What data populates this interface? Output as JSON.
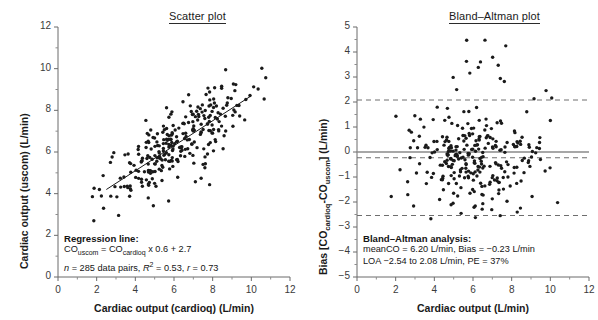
{
  "figure": {
    "left_panel": {
      "title": "Scatter plot",
      "xlabel": "Cardiac output (cardioq) (L/min)",
      "ylabel": "Cardiac output (uscom) (L/min)",
      "annotation": {
        "heading": "Regression line:",
        "equation_prefix": "CO",
        "equation_sub1": "uscom",
        "equation_mid": " = CO",
        "equation_sub2": "cardioq",
        "equation_suffix": " x 0.6 + 2.7",
        "stats_n": "n",
        "stats_rest": " = 285 data pairs, ",
        "stats_r2_base": "R",
        "stats_r2_exp": "2",
        "stats_r2_val": " = 0.53, ",
        "stats_r_base": "r",
        "stats_r_val": " = 0.73"
      }
    },
    "right_panel": {
      "title": "Bland–Altman plot",
      "xlabel": "Cardiac output (L/min)",
      "ylabel": "Bias [COcardioq-COuscom] (L/min)",
      "annotation": {
        "heading": "Bland–Altman analysis:",
        "line2": "meanCO = 6.20 L/min, Bias = −0.23 L/min",
        "line3": "LOA −2.54 to 2.08 L/min, PE = 37%"
      }
    }
  },
  "chart_data": [
    {
      "type": "scatter",
      "id": "scatter-plot",
      "title": "Scatter plot",
      "xlabel": "Cardiac output (cardioq) (L/min)",
      "ylabel": "Cardiac output (uscom) (L/min)",
      "xlim": [
        0,
        12
      ],
      "ylim": [
        0,
        12
      ],
      "xticks": [
        0,
        2,
        4,
        6,
        8,
        10,
        12
      ],
      "yticks": [
        0,
        2,
        4,
        6,
        8,
        10,
        12
      ],
      "minor_ticks": true,
      "grid": false,
      "n_points": 285,
      "marker_color": "#1a1a1a",
      "marker_size_px": 3.4,
      "regression_line": {
        "slope": 0.6,
        "intercept": 2.7,
        "x_start": 2.5,
        "x_end": 10.0,
        "color": "#1a1a1a"
      },
      "statistics": {
        "n": 285,
        "r_squared": 0.53,
        "r": 0.73,
        "equation": "COuscom = COcardioq x 0.6 + 2.7"
      },
      "point_generation": {
        "seed": 20240517,
        "x_mean": 6.2,
        "x_sd": 1.75,
        "x_min": 1.6,
        "x_max": 11.2,
        "residual_sd": 0.82,
        "note": "y = 2.7 + 0.6*x + noise"
      }
    },
    {
      "type": "scatter",
      "id": "bland-altman-plot",
      "title": "Bland–Altman plot",
      "xlabel": "Cardiac output (L/min)",
      "ylabel": "Bias [COcardioq-COuscom] (L/min)",
      "xlim": [
        0,
        12
      ],
      "ylim": [
        -5,
        5
      ],
      "xticks": [
        0,
        2,
        4,
        6,
        8,
        10,
        12
      ],
      "yticks": [
        -5,
        -4,
        -3,
        -2,
        -1,
        0,
        1,
        2,
        3,
        4,
        5
      ],
      "minor_ticks": true,
      "grid": false,
      "n_points": 285,
      "marker_color": "#1a1a1a",
      "marker_size_px": 3.4,
      "reference_lines": [
        {
          "name": "zero-line",
          "value": 0,
          "style": "solid",
          "color": "#8a8a8a"
        },
        {
          "name": "bias-line",
          "value": -0.23,
          "style": "dashed",
          "color": "#6e6e6e"
        },
        {
          "name": "upper-loa-line",
          "value": 2.08,
          "style": "dashed",
          "color": "#6e6e6e"
        },
        {
          "name": "lower-loa-line",
          "value": -2.54,
          "style": "dashed",
          "color": "#6e6e6e"
        }
      ],
      "statistics": {
        "mean_co": 6.2,
        "bias": -0.23,
        "loa_lower": -2.54,
        "loa_upper": 2.08,
        "percentage_error": 37
      },
      "point_generation": {
        "seed": 91123,
        "x_mean": 6.2,
        "x_sd": 1.75,
        "x_min": 1.6,
        "x_max": 11.2,
        "bias": -0.23,
        "residual_sd": 1.0,
        "note": "bias values scattered about -0.23 with SD ~1.18, slight upward outlier cluster"
      }
    }
  ]
}
